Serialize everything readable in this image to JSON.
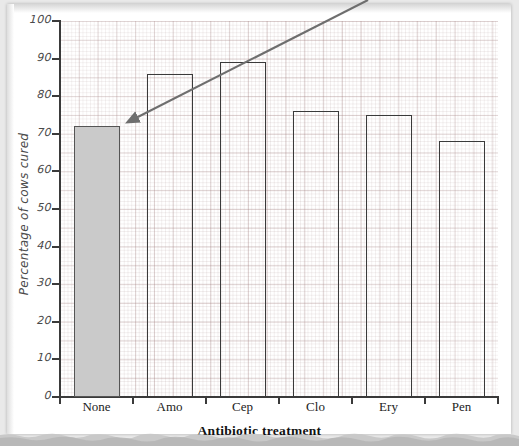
{
  "chart_data": {
    "type": "bar",
    "title": "",
    "subtitle": "",
    "xlabel": "Antibiotic treatment",
    "ylabel": "Percentage of cows cured",
    "categories": [
      "None",
      "Amo",
      "Cep",
      "Clo",
      "Ery",
      "Pen"
    ],
    "values": [
      72,
      86,
      89,
      76,
      75,
      68
    ],
    "ylim": [
      0,
      100
    ],
    "ytick_labels": [
      "0",
      "10",
      "20",
      "30",
      "40",
      "50",
      "60",
      "70",
      "80",
      "90",
      "100"
    ],
    "ytick_values": [
      0,
      10,
      20,
      30,
      40,
      50,
      60,
      70,
      80,
      90,
      100
    ],
    "grid": true,
    "grid_style": "graph-paper",
    "legend": "none",
    "bar_styles": [
      {
        "category": "None",
        "fill": "#cacaca",
        "stroke": "#555555",
        "filled": true
      },
      {
        "category": "Amo",
        "fill": "none",
        "stroke": "#3a3a3a",
        "filled": false
      },
      {
        "category": "Cep",
        "fill": "none",
        "stroke": "#3a3a3a",
        "filled": false
      },
      {
        "category": "Clo",
        "fill": "none",
        "stroke": "#3a3a3a",
        "filled": false
      },
      {
        "category": "Ery",
        "fill": "none",
        "stroke": "#3a3a3a",
        "filled": false
      },
      {
        "category": "Pen",
        "fill": "none",
        "stroke": "#3a3a3a",
        "filled": false
      }
    ],
    "annotations": [
      {
        "name": "pointer-arrow",
        "type": "arrow",
        "points_to_category": "None",
        "points_to_value": 72,
        "color": "#6e6e6e"
      }
    ]
  },
  "colors": {
    "paper": "#ffffff",
    "page_background": "#e9e9e9",
    "axis": "#3a3a3a",
    "bar_fill": "#cacaca",
    "bar_stroke": "#3a3a3a",
    "grid_minor": "#cfbcbc",
    "grid_major": "#b59a9a",
    "label_text": "#4a4a4a",
    "title_text": "#111111",
    "arrow": "#6e6e6e"
  }
}
